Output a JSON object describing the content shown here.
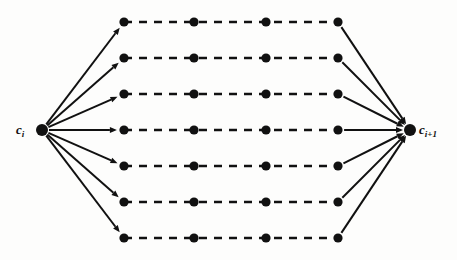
{
  "figure": {
    "type": "trellis-diagram",
    "width": 457,
    "height": 260,
    "background_color": "#fdfdfc",
    "ink_color": "#111111"
  },
  "labels": {
    "start": {
      "base": "c",
      "sub": "i",
      "x": 16,
      "y": 123
    },
    "end": {
      "base": "c",
      "sub": "i+1",
      "x": 419,
      "y": 123
    }
  },
  "terminals": {
    "start": {
      "name": "c_i",
      "x": 42,
      "y": 130,
      "radius": 6
    },
    "end": {
      "name": "c_i+1",
      "x": 410,
      "y": 130,
      "radius": 6
    }
  },
  "grid": {
    "node_radius": 4.6,
    "column_x": [
      124,
      194,
      266,
      338
    ],
    "row_y": [
      22,
      58,
      94,
      130,
      166,
      202,
      238
    ],
    "rows": 7,
    "columns": 4
  },
  "edges": {
    "fan_in": {
      "style": "solid",
      "arrowhead": true,
      "count": 7,
      "from": "c_i",
      "to": "column_1_nodes"
    },
    "path": {
      "style": "dashed",
      "arrowhead": false,
      "dash_length": 8,
      "dash_gap": 7,
      "stroke_width": 2.6
    },
    "fan_out": {
      "style": "solid",
      "arrowhead": true,
      "count": 7,
      "from": "column_4_nodes",
      "to": "c_i+1"
    }
  },
  "style": {
    "solid_stroke_width": 2.0,
    "dashed_stroke_width": 2.6,
    "arrow_size": 7
  }
}
